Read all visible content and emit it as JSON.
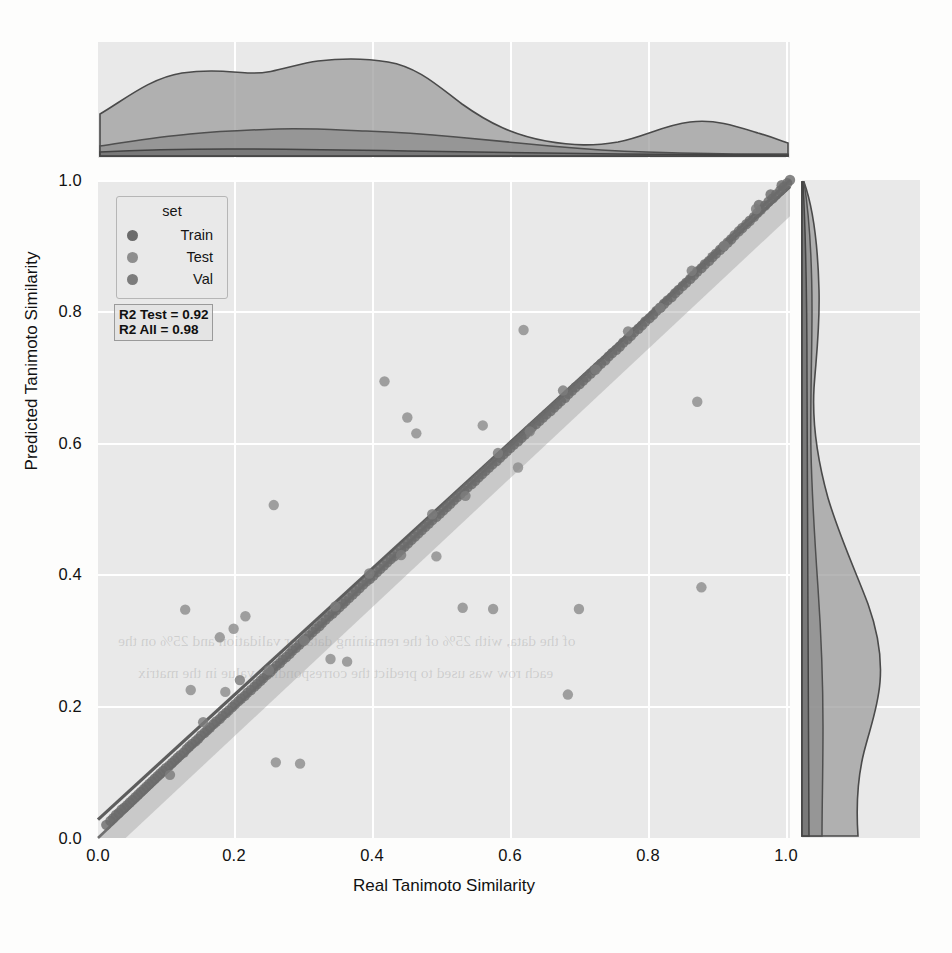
{
  "figure": {
    "kind": "joint-scatter-regression-with-marginal-kde",
    "xlabel": "Real Tanimoto Similarity",
    "ylabel": "Predicted Tanimoto Similarity",
    "background": "#e9e9e9",
    "gridcolor": "#ffffff"
  },
  "legend": {
    "title": "set",
    "items": [
      {
        "label": "Train",
        "color": "#6b6b6b"
      },
      {
        "label": "Test",
        "color": "#8e8e8e"
      },
      {
        "label": "Val",
        "color": "#7c7c7c"
      }
    ]
  },
  "annotations": {
    "r2_test": "R2 Test = 0.92",
    "r2_all": "R2 All = 0.98"
  },
  "ghost_text": {
    "line1": "of the data, with 25% of the remaining data for validation and 25% on the",
    "line2": "each row was used to predict the corresponding value in the matrix"
  },
  "chart_data": {
    "type": "scatter",
    "title": "",
    "xlabel": "Real Tanimoto Similarity",
    "ylabel": "Predicted Tanimoto Similarity",
    "xlim": [
      0.0,
      1.0
    ],
    "ylim": [
      0.0,
      1.0
    ],
    "xticks": [
      "0.0",
      "0.2",
      "0.4",
      "0.6",
      "0.8",
      "1.0"
    ],
    "yticks": [
      "0.0",
      "0.2",
      "0.4",
      "0.6",
      "0.8",
      "1.0"
    ],
    "xtickvals": [
      0.0,
      0.2,
      0.4,
      0.6,
      0.8,
      1.0
    ],
    "ytickvals": [
      0.0,
      0.2,
      0.4,
      0.6,
      0.8,
      1.0
    ],
    "grid": true,
    "legend_position": "upper-left",
    "reference_line": {
      "name": "y = x",
      "slope": 1.0,
      "intercept": 0.0,
      "color": "#707070"
    },
    "regression_line": {
      "name": "fit",
      "slope": 0.962,
      "intercept": 0.028,
      "color": "#5d5d5d",
      "ci_band": true
    },
    "series": [
      {
        "name": "Train",
        "color": "#6b6b6b",
        "points": [
          [
            0.012,
            0.02
          ],
          [
            0.018,
            0.026
          ],
          [
            0.022,
            0.03
          ],
          [
            0.026,
            0.035
          ],
          [
            0.03,
            0.038
          ],
          [
            0.034,
            0.043
          ],
          [
            0.038,
            0.046
          ],
          [
            0.042,
            0.05
          ],
          [
            0.046,
            0.054
          ],
          [
            0.05,
            0.058
          ],
          [
            0.054,
            0.062
          ],
          [
            0.058,
            0.066
          ],
          [
            0.062,
            0.07
          ],
          [
            0.066,
            0.074
          ],
          [
            0.07,
            0.078
          ],
          [
            0.074,
            0.082
          ],
          [
            0.078,
            0.086
          ],
          [
            0.082,
            0.09
          ],
          [
            0.086,
            0.094
          ],
          [
            0.09,
            0.098
          ],
          [
            0.094,
            0.102
          ],
          [
            0.098,
            0.106
          ],
          [
            0.103,
            0.11
          ],
          [
            0.107,
            0.114
          ],
          [
            0.111,
            0.118
          ],
          [
            0.115,
            0.122
          ],
          [
            0.119,
            0.126
          ],
          [
            0.124,
            0.13
          ],
          [
            0.128,
            0.135
          ],
          [
            0.132,
            0.139
          ],
          [
            0.136,
            0.143
          ],
          [
            0.141,
            0.147
          ],
          [
            0.145,
            0.151
          ],
          [
            0.149,
            0.156
          ],
          [
            0.154,
            0.16
          ],
          [
            0.158,
            0.164
          ],
          [
            0.162,
            0.168
          ],
          [
            0.167,
            0.173
          ],
          [
            0.171,
            0.177
          ],
          [
            0.176,
            0.181
          ],
          [
            0.18,
            0.186
          ],
          [
            0.185,
            0.19
          ],
          [
            0.189,
            0.194
          ],
          [
            0.194,
            0.199
          ],
          [
            0.198,
            0.203
          ],
          [
            0.203,
            0.208
          ],
          [
            0.207,
            0.212
          ],
          [
            0.212,
            0.216
          ],
          [
            0.216,
            0.221
          ],
          [
            0.221,
            0.225
          ],
          [
            0.226,
            0.23
          ],
          [
            0.23,
            0.234
          ],
          [
            0.235,
            0.239
          ],
          [
            0.239,
            0.243
          ],
          [
            0.244,
            0.248
          ],
          [
            0.249,
            0.252
          ],
          [
            0.253,
            0.257
          ],
          [
            0.258,
            0.262
          ],
          [
            0.263,
            0.266
          ],
          [
            0.267,
            0.271
          ],
          [
            0.272,
            0.275
          ],
          [
            0.277,
            0.28
          ],
          [
            0.281,
            0.285
          ],
          [
            0.286,
            0.289
          ],
          [
            0.291,
            0.294
          ],
          [
            0.296,
            0.299
          ],
          [
            0.3,
            0.303
          ],
          [
            0.305,
            0.308
          ],
          [
            0.31,
            0.313
          ],
          [
            0.315,
            0.318
          ],
          [
            0.32,
            0.322
          ],
          [
            0.324,
            0.327
          ],
          [
            0.329,
            0.332
          ],
          [
            0.334,
            0.337
          ],
          [
            0.339,
            0.341
          ],
          [
            0.344,
            0.346
          ],
          [
            0.349,
            0.351
          ],
          [
            0.354,
            0.356
          ],
          [
            0.358,
            0.36
          ],
          [
            0.363,
            0.365
          ],
          [
            0.368,
            0.37
          ],
          [
            0.373,
            0.375
          ],
          [
            0.378,
            0.38
          ],
          [
            0.383,
            0.385
          ],
          [
            0.388,
            0.39
          ],
          [
            0.393,
            0.394
          ],
          [
            0.398,
            0.399
          ],
          [
            0.403,
            0.404
          ],
          [
            0.408,
            0.409
          ],
          [
            0.413,
            0.414
          ],
          [
            0.418,
            0.419
          ],
          [
            0.423,
            0.424
          ],
          [
            0.428,
            0.428
          ],
          [
            0.433,
            0.433
          ],
          [
            0.438,
            0.438
          ],
          [
            0.443,
            0.443
          ],
          [
            0.448,
            0.448
          ],
          [
            0.453,
            0.453
          ],
          [
            0.458,
            0.458
          ],
          [
            0.463,
            0.463
          ],
          [
            0.468,
            0.468
          ],
          [
            0.473,
            0.473
          ],
          [
            0.478,
            0.478
          ],
          [
            0.483,
            0.483
          ],
          [
            0.489,
            0.488
          ],
          [
            0.494,
            0.493
          ],
          [
            0.499,
            0.498
          ],
          [
            0.504,
            0.503
          ],
          [
            0.509,
            0.508
          ],
          [
            0.514,
            0.513
          ],
          [
            0.519,
            0.518
          ],
          [
            0.524,
            0.523
          ],
          [
            0.529,
            0.528
          ],
          [
            0.534,
            0.533
          ],
          [
            0.54,
            0.538
          ],
          [
            0.545,
            0.543
          ],
          [
            0.55,
            0.548
          ],
          [
            0.555,
            0.553
          ],
          [
            0.56,
            0.558
          ],
          [
            0.565,
            0.563
          ],
          [
            0.57,
            0.568
          ],
          [
            0.576,
            0.573
          ],
          [
            0.581,
            0.578
          ],
          [
            0.586,
            0.583
          ],
          [
            0.591,
            0.588
          ],
          [
            0.596,
            0.593
          ],
          [
            0.601,
            0.598
          ],
          [
            0.607,
            0.603
          ],
          [
            0.612,
            0.608
          ],
          [
            0.617,
            0.613
          ],
          [
            0.622,
            0.619
          ],
          [
            0.627,
            0.624
          ],
          [
            0.633,
            0.629
          ],
          [
            0.638,
            0.634
          ],
          [
            0.643,
            0.639
          ],
          [
            0.648,
            0.644
          ],
          [
            0.654,
            0.649
          ],
          [
            0.659,
            0.654
          ],
          [
            0.664,
            0.659
          ],
          [
            0.669,
            0.664
          ],
          [
            0.675,
            0.669
          ],
          [
            0.68,
            0.675
          ],
          [
            0.685,
            0.68
          ],
          [
            0.69,
            0.685
          ],
          [
            0.696,
            0.69
          ],
          [
            0.701,
            0.695
          ],
          [
            0.706,
            0.7
          ],
          [
            0.712,
            0.706
          ],
          [
            0.717,
            0.711
          ],
          [
            0.722,
            0.716
          ],
          [
            0.727,
            0.721
          ],
          [
            0.733,
            0.726
          ],
          [
            0.738,
            0.732
          ],
          [
            0.743,
            0.737
          ],
          [
            0.749,
            0.742
          ],
          [
            0.754,
            0.747
          ],
          [
            0.759,
            0.753
          ],
          [
            0.765,
            0.758
          ],
          [
            0.77,
            0.763
          ],
          [
            0.775,
            0.769
          ],
          [
            0.781,
            0.774
          ],
          [
            0.786,
            0.779
          ],
          [
            0.791,
            0.785
          ],
          [
            0.797,
            0.79
          ],
          [
            0.802,
            0.795
          ],
          [
            0.807,
            0.801
          ],
          [
            0.813,
            0.806
          ],
          [
            0.818,
            0.812
          ],
          [
            0.823,
            0.817
          ],
          [
            0.829,
            0.822
          ],
          [
            0.834,
            0.828
          ],
          [
            0.839,
            0.833
          ],
          [
            0.845,
            0.839
          ],
          [
            0.85,
            0.844
          ],
          [
            0.856,
            0.85
          ],
          [
            0.861,
            0.855
          ],
          [
            0.866,
            0.861
          ],
          [
            0.872,
            0.866
          ],
          [
            0.877,
            0.872
          ],
          [
            0.883,
            0.877
          ],
          [
            0.888,
            0.883
          ],
          [
            0.893,
            0.888
          ],
          [
            0.899,
            0.894
          ],
          [
            0.904,
            0.899
          ],
          [
            0.91,
            0.905
          ],
          [
            0.915,
            0.91
          ],
          [
            0.92,
            0.916
          ],
          [
            0.926,
            0.922
          ],
          [
            0.931,
            0.927
          ],
          [
            0.937,
            0.933
          ],
          [
            0.942,
            0.938
          ],
          [
            0.948,
            0.944
          ],
          [
            0.953,
            0.95
          ],
          [
            0.958,
            0.955
          ],
          [
            0.964,
            0.961
          ],
          [
            0.969,
            0.967
          ],
          [
            0.975,
            0.972
          ],
          [
            0.98,
            0.978
          ],
          [
            0.986,
            0.984
          ],
          [
            0.991,
            0.989
          ],
          [
            0.996,
            0.995
          ],
          [
            1.0,
            1.0
          ],
          [
            0.988,
            0.992
          ],
          [
            0.972,
            0.978
          ],
          [
            0.955,
            0.962
          ]
        ]
      },
      {
        "name": "Test",
        "color": "#8e8e8e",
        "points": [
          [
            0.126,
            0.347
          ],
          [
            0.134,
            0.225
          ],
          [
            0.176,
            0.305
          ],
          [
            0.184,
            0.222
          ],
          [
            0.196,
            0.318
          ],
          [
            0.213,
            0.337
          ],
          [
            0.254,
            0.506
          ],
          [
            0.257,
            0.115
          ],
          [
            0.292,
            0.113
          ],
          [
            0.336,
            0.272
          ],
          [
            0.36,
            0.268
          ],
          [
            0.414,
            0.694
          ],
          [
            0.447,
            0.639
          ],
          [
            0.46,
            0.615
          ],
          [
            0.489,
            0.428
          ],
          [
            0.527,
            0.35
          ],
          [
            0.556,
            0.627
          ],
          [
            0.571,
            0.348
          ],
          [
            0.607,
            0.563
          ],
          [
            0.615,
            0.772
          ],
          [
            0.679,
            0.218
          ],
          [
            0.695,
            0.348
          ],
          [
            0.866,
            0.663
          ],
          [
            0.872,
            0.381
          ]
        ]
      },
      {
        "name": "Val",
        "color": "#7c7c7c",
        "points": [
          [
            0.104,
            0.096
          ],
          [
            0.152,
            0.176
          ],
          [
            0.205,
            0.24
          ],
          [
            0.247,
            0.255
          ],
          [
            0.298,
            0.3
          ],
          [
            0.343,
            0.352
          ],
          [
            0.392,
            0.402
          ],
          [
            0.438,
            0.43
          ],
          [
            0.483,
            0.492
          ],
          [
            0.531,
            0.52
          ],
          [
            0.578,
            0.585
          ],
          [
            0.624,
            0.618
          ],
          [
            0.672,
            0.68
          ],
          [
            0.719,
            0.712
          ],
          [
            0.766,
            0.77
          ],
          [
            0.812,
            0.806
          ],
          [
            0.858,
            0.862
          ],
          [
            0.905,
            0.9
          ],
          [
            0.951,
            0.956
          ]
        ]
      }
    ],
    "marginal_x": {
      "orientation": "horizontal",
      "note": "KDE of Real Tanimoto Similarity per set",
      "curves": [
        {
          "name": "Train",
          "peak_x": 0.3,
          "support": [
            0.0,
            1.0
          ],
          "relative_area": 1.0
        },
        {
          "name": "Test",
          "peak_x": 0.27,
          "support": [
            0.0,
            1.0
          ],
          "relative_area": 0.22
        },
        {
          "name": "Val",
          "peak_x": 0.25,
          "support": [
            0.0,
            1.0
          ],
          "relative_area": 0.06
        }
      ]
    },
    "marginal_y": {
      "orientation": "vertical",
      "note": "KDE of Predicted Tanimoto Similarity per set",
      "curves": [
        {
          "name": "Train",
          "peak_y": 0.33,
          "support": [
            0.0,
            1.0
          ],
          "relative_area": 1.0
        },
        {
          "name": "Test",
          "peak_y": 0.3,
          "support": [
            0.0,
            1.0
          ],
          "relative_area": 0.2
        },
        {
          "name": "Val",
          "peak_y": 0.28,
          "support": [
            0.0,
            1.0
          ],
          "relative_area": 0.06
        }
      ]
    }
  }
}
